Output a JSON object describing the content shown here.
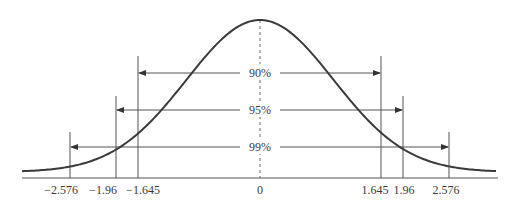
{
  "diagram": {
    "colors": {
      "curve": "#3a3a3a",
      "lines": "#555555",
      "text": "#3a3a3a",
      "background": "#ffffff"
    },
    "center_label": "0",
    "intervals": [
      {
        "label": "90%",
        "low": -1.645,
        "high": 1.645,
        "low_label": "−1.645",
        "high_label": "1.645"
      },
      {
        "label": "95%",
        "low": -1.96,
        "high": 1.96,
        "low_label": "−1.96",
        "high_label": "1.96"
      },
      {
        "label": "99%",
        "low": -2.576,
        "high": 2.576,
        "low_label": "−2.576",
        "high_label": "2.576"
      }
    ]
  },
  "chart_data": {
    "type": "line",
    "title": "",
    "xlabel": "",
    "ylabel": "",
    "curve": "standard normal density",
    "xlim": [
      -3.2,
      3.2
    ],
    "tick_labels": [
      "−2.576",
      "−1.96",
      "−1.645",
      "0",
      "1.645",
      "1.96",
      "2.576"
    ],
    "ticks": [
      -2.576,
      -1.96,
      -1.645,
      0,
      1.645,
      1.96,
      2.576
    ],
    "annotations": [
      "90%",
      "95%",
      "99%"
    ],
    "grid": false
  }
}
